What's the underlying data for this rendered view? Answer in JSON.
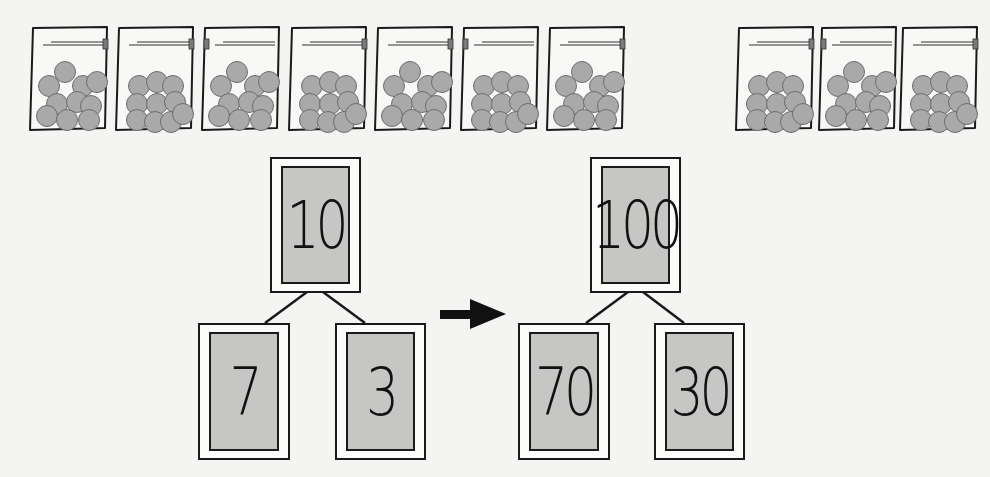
{
  "bags": {
    "count": 10,
    "balls_per_bag": 10,
    "positions_x": [
      27,
      113,
      199,
      286,
      372,
      458,
      544,
      733,
      816,
      897
    ],
    "colors": {
      "ball_fill": "#a9a9a9",
      "ball_stroke": "#6e6e6e",
      "bag_stroke": "#1a1a1a"
    }
  },
  "tree_left": {
    "whole": "10",
    "parts": [
      "7",
      "3"
    ]
  },
  "arrow": {
    "direction": "right"
  },
  "tree_right": {
    "whole": "100",
    "parts": [
      "70",
      "30"
    ]
  },
  "colors": {
    "background": "#f4f4f2",
    "box_fill": "#c6c6c4",
    "outline": "#1a1a1a"
  }
}
